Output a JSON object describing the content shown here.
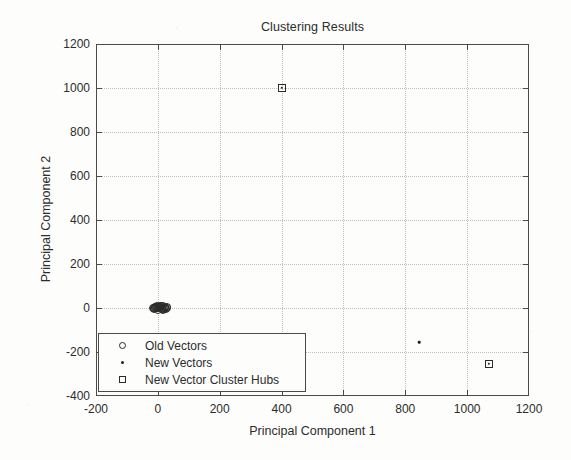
{
  "chart_data": {
    "type": "scatter",
    "title": "Clustering Results",
    "xlabel": "Principal Component 1",
    "ylabel": "Principal Component 2",
    "xlim": [
      -200,
      1200
    ],
    "ylim": [
      -400,
      1200
    ],
    "xticks": [
      -200,
      0,
      200,
      400,
      600,
      800,
      1000,
      1200
    ],
    "yticks": [
      -400,
      -200,
      0,
      200,
      400,
      600,
      800,
      1000,
      1200
    ],
    "xticklabels": [
      "-200",
      "0",
      "200",
      "400",
      "600",
      "800",
      "1000",
      "1200"
    ],
    "yticklabels": [
      "-400",
      "-200",
      "0",
      "200",
      "400",
      "600",
      "800",
      "1000",
      "1200"
    ],
    "grid": true,
    "grid_style": "dotted",
    "legend_position": "lower left",
    "series": [
      {
        "name": "Old Vectors",
        "marker": "circle",
        "points": [
          [
            -10,
            6
          ],
          [
            -4,
            2
          ],
          [
            2,
            -2
          ],
          [
            8,
            4
          ],
          [
            14,
            0
          ],
          [
            20,
            -4
          ],
          [
            -14,
            -6
          ],
          [
            -2,
            10
          ],
          [
            10,
            8
          ],
          [
            16,
            -8
          ],
          [
            4,
            6
          ],
          [
            -8,
            -2
          ],
          [
            22,
            4
          ],
          [
            0,
            -8
          ],
          [
            12,
            -6
          ],
          [
            6,
            10
          ],
          [
            18,
            8
          ],
          [
            -6,
            4
          ],
          [
            24,
            -2
          ],
          [
            -12,
            2
          ],
          [
            28,
            2
          ],
          [
            26,
            -6
          ],
          [
            30,
            4
          ],
          [
            -16,
            0
          ]
        ]
      },
      {
        "name": "New Vectors",
        "marker": "dot",
        "points": [
          [
            845,
            -155
          ]
        ]
      },
      {
        "name": "New Vector Cluster Hubs",
        "marker": "square",
        "points": [
          [
            400,
            1000
          ],
          [
            1070,
            -255
          ]
        ]
      }
    ]
  },
  "legend": {
    "entries": [
      {
        "label": "Old Vectors",
        "marker": "circle-marker"
      },
      {
        "label": "New Vectors",
        "marker": "dot-marker"
      },
      {
        "label": "New Vector Cluster Hubs",
        "marker": "square-marker"
      }
    ]
  },
  "colors": {
    "axis": "#4a4a4a",
    "grid": "#c0c0c0",
    "marker": "#2b2b2b",
    "text": "#2c2c2c",
    "background": "#fdfdfc"
  }
}
